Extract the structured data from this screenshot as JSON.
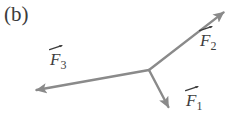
{
  "figure": {
    "panel_label": "(b)",
    "background_color": "#ffffff",
    "stroke_color": "#8a8a8a",
    "label_color": "#3d3d3d",
    "width": 237,
    "height": 119
  },
  "chart_data": {
    "type": "scatter",
    "title": "(b)",
    "xlabel": "",
    "ylabel": "",
    "origin": {
      "x": 149,
      "y": 70
    },
    "xlim": [
      0,
      237
    ],
    "ylim": [
      0,
      119
    ],
    "grid": false,
    "legend_position": "none",
    "series": [
      {
        "name": "F1",
        "label": "F",
        "subscript": "1",
        "tail": {
          "x": 149,
          "y": 70
        },
        "tip": {
          "x": 171,
          "y": 112
        },
        "angle_deg": -62,
        "length_px": 47,
        "label_position": {
          "x": 186,
          "y": 92
        }
      },
      {
        "name": "F2",
        "label": "F",
        "subscript": "2",
        "tail": {
          "x": 149,
          "y": 70
        },
        "tip": {
          "x": 228,
          "y": 9
        },
        "angle_deg": 38,
        "length_px": 100,
        "label_position": {
          "x": 200,
          "y": 32
        }
      },
      {
        "name": "F3",
        "label": "F",
        "subscript": "3",
        "tail": {
          "x": 149,
          "y": 70
        },
        "tip": {
          "x": 31,
          "y": 91
        },
        "angle_deg": 190,
        "length_px": 120,
        "label_position": {
          "x": 50,
          "y": 51
        }
      }
    ]
  },
  "labels": {
    "f1": {
      "base": "F",
      "sub": "1"
    },
    "f2": {
      "base": "F",
      "sub": "2"
    },
    "f3": {
      "base": "F",
      "sub": "3"
    }
  }
}
